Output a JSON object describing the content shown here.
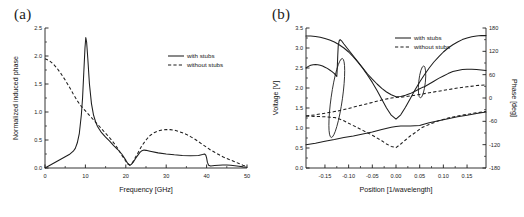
{
  "figure": {
    "background_color": "#ffffff",
    "line_color": "#1d1d1d",
    "panels": [
      "(a)",
      "(b)"
    ]
  },
  "panel_a": {
    "label": "(a)",
    "legend": {
      "position": "upper-right",
      "entries": [
        {
          "label": "with stubs",
          "style": "solid"
        },
        {
          "label": "without stubs",
          "style": "dashed"
        }
      ]
    }
  },
  "panel_b": {
    "label": "(b)",
    "legend": {
      "position": "upper-right",
      "entries": [
        {
          "label": "with stubs",
          "style": "solid"
        },
        {
          "label": "without stubs",
          "style": "dashed"
        }
      ]
    },
    "annotations": [
      {
        "name": "ellipse-left",
        "cx": -0.125,
        "cy_frac": 0.5,
        "rx": 0.012,
        "ry_frac": 0.285,
        "rotation": 8
      },
      {
        "name": "ellipse-right",
        "cx": 0.055,
        "cy_frac": 0.385,
        "rx": 0.007,
        "ry_frac": 0.115,
        "rotation": 6
      }
    ]
  },
  "chart_data": [
    {
      "id": "panel-a",
      "type": "line",
      "title": "(a)",
      "xlabel": "Frequency [GHz]",
      "ylabel": "Normalized induced phase",
      "xlim": [
        0,
        50
      ],
      "ylim": [
        0.0,
        2.5
      ],
      "xticks": [
        0,
        10,
        20,
        30,
        40,
        50
      ],
      "xticklabels": [
        "0",
        "10",
        "20",
        "30",
        "40",
        "50"
      ],
      "yticks": [
        0.0,
        0.5,
        1.0,
        1.5,
        2.0,
        2.5
      ],
      "yticklabels": [
        "0.0",
        "0.5",
        "1.0",
        "1.5",
        "2.0",
        "2.5"
      ],
      "xminor_count": 1,
      "yminor_count": 1,
      "grid": false,
      "legend_position": "upper right",
      "series": [
        {
          "name": "with stubs",
          "style": "solid",
          "x": [
            0,
            1,
            2,
            3,
            4,
            5,
            6,
            7,
            7.5,
            8,
            8.5,
            9,
            9.3,
            9.6,
            9.9,
            10.1,
            10.3,
            10.6,
            11,
            11.5,
            12,
            12.5,
            13,
            14,
            15,
            16,
            17,
            18,
            19,
            20,
            20.5,
            21,
            21.3,
            21.8,
            22.5,
            23,
            23.5,
            24,
            24.5,
            25,
            26,
            28,
            30,
            32,
            34,
            36,
            38,
            39,
            39.5,
            39.8,
            40,
            40.2,
            40.5,
            41,
            41.5,
            42,
            43,
            44,
            45,
            46,
            47,
            48,
            49,
            50
          ],
          "y": [
            0.0,
            0.04,
            0.08,
            0.12,
            0.16,
            0.2,
            0.24,
            0.3,
            0.35,
            0.45,
            0.62,
            0.95,
            1.25,
            1.7,
            2.15,
            2.33,
            2.25,
            1.95,
            1.5,
            1.15,
            0.95,
            0.83,
            0.74,
            0.63,
            0.55,
            0.48,
            0.4,
            0.33,
            0.25,
            0.14,
            0.08,
            0.05,
            0.06,
            0.1,
            0.18,
            0.23,
            0.28,
            0.31,
            0.32,
            0.315,
            0.3,
            0.27,
            0.25,
            0.235,
            0.225,
            0.22,
            0.225,
            0.24,
            0.25,
            0.23,
            0.18,
            0.1,
            0.05,
            0.035,
            0.04,
            0.045,
            0.05,
            0.055,
            0.055,
            0.05,
            0.04,
            0.03,
            0.02,
            0.015
          ]
        },
        {
          "name": "without stubs",
          "style": "dashed",
          "x": [
            0,
            1,
            2,
            3,
            4,
            5,
            6,
            7,
            8,
            9,
            10,
            11,
            12,
            13,
            14,
            15,
            16,
            17,
            18,
            19,
            20,
            20.5,
            21,
            21.5,
            22,
            23,
            24,
            25,
            26,
            27,
            28,
            29,
            30,
            31,
            32,
            33,
            34,
            35,
            36,
            37,
            38,
            39,
            40,
            41,
            42,
            43,
            44,
            45,
            46,
            47,
            48,
            49,
            50
          ],
          "y": [
            1.95,
            1.92,
            1.86,
            1.78,
            1.68,
            1.57,
            1.45,
            1.32,
            1.2,
            1.1,
            1.02,
            0.94,
            0.86,
            0.78,
            0.7,
            0.62,
            0.54,
            0.45,
            0.35,
            0.23,
            0.12,
            0.07,
            0.05,
            0.08,
            0.14,
            0.27,
            0.4,
            0.5,
            0.58,
            0.63,
            0.66,
            0.68,
            0.685,
            0.685,
            0.675,
            0.655,
            0.63,
            0.6,
            0.56,
            0.52,
            0.47,
            0.42,
            0.37,
            0.32,
            0.28,
            0.24,
            0.2,
            0.17,
            0.14,
            0.11,
            0.08,
            0.05,
            0.03
          ]
        }
      ]
    },
    {
      "id": "panel-b",
      "type": "line",
      "title": "(b)",
      "xlabel": "Position [1/wavelength]",
      "ylabel": "Voltage [V]",
      "y2label": "Phase [deg]",
      "xlim": [
        -0.19,
        0.19
      ],
      "ylim": [
        0.0,
        3.5
      ],
      "y2lim": [
        -180,
        180
      ],
      "xticks": [
        -0.15,
        -0.1,
        -0.05,
        0.0,
        0.05,
        0.1,
        0.15
      ],
      "xticklabels": [
        "-0.15",
        "-0.10",
        "-0.05",
        "0.00",
        "0.05",
        "0.10",
        "0.15"
      ],
      "yticks": [
        0.0,
        0.5,
        1.0,
        1.5,
        2.0,
        2.5,
        3.0,
        3.5
      ],
      "yticklabels": [
        "0.0",
        "0.5",
        "1.0",
        "1.5",
        "2.0",
        "2.5",
        "3.0",
        "3.5"
      ],
      "y2ticks": [
        -180,
        -120,
        -60,
        0,
        60,
        120,
        180
      ],
      "y2ticklabels": [
        "-180",
        "-120",
        "-60",
        "0",
        "60",
        "120",
        "180"
      ],
      "xminor_count": 1,
      "yminor_count": 1,
      "grid": false,
      "legend_position": "upper right",
      "series": [
        {
          "name": "with stubs (voltage, upper)",
          "style": "solid",
          "axis": "left",
          "x": [
            -0.19,
            -0.18,
            -0.17,
            -0.16,
            -0.15,
            -0.14,
            -0.13,
            -0.12,
            -0.11,
            -0.1,
            -0.09,
            -0.08,
            -0.07,
            -0.06,
            -0.05,
            -0.04,
            -0.03,
            -0.02,
            -0.01,
            0.0,
            0.01,
            0.02,
            0.03,
            0.04,
            0.05,
            0.06,
            0.07,
            0.08,
            0.09,
            0.1,
            0.11,
            0.12,
            0.13,
            0.14,
            0.15,
            0.16,
            0.17,
            0.18,
            0.19
          ],
          "y": [
            3.3,
            3.3,
            3.29,
            3.27,
            3.24,
            3.2,
            3.15,
            3.08,
            3.0,
            2.9,
            2.78,
            2.64,
            2.49,
            2.32,
            2.14,
            1.94,
            1.72,
            1.5,
            1.32,
            1.22,
            1.33,
            1.52,
            1.73,
            1.95,
            2.15,
            2.33,
            2.5,
            2.65,
            2.78,
            2.9,
            3.0,
            3.08,
            3.15,
            3.21,
            3.25,
            3.28,
            3.3,
            3.31,
            3.31
          ]
        },
        {
          "name": "with stubs (voltage, middle)",
          "style": "solid",
          "axis": "left",
          "x": [
            -0.19,
            -0.185,
            -0.18,
            -0.175,
            -0.17,
            -0.165,
            -0.16,
            -0.155,
            -0.15,
            -0.145,
            -0.14,
            -0.135,
            -0.13,
            -0.128,
            -0.126,
            -0.125,
            -0.124,
            -0.123,
            -0.122,
            -0.12,
            -0.118,
            -0.115,
            -0.11,
            -0.1,
            -0.09,
            -0.08,
            -0.07,
            -0.06,
            -0.05,
            -0.04,
            -0.03,
            -0.02,
            -0.01,
            0.0,
            0.01,
            0.02,
            0.03,
            0.04,
            0.05,
            0.055,
            0.06,
            0.07,
            0.08,
            0.09,
            0.1,
            0.11,
            0.12,
            0.13,
            0.14,
            0.15,
            0.16,
            0.17,
            0.18,
            0.19
          ],
          "y": [
            2.5,
            2.54,
            2.57,
            2.58,
            2.585,
            2.58,
            2.57,
            2.55,
            2.52,
            2.49,
            2.45,
            2.41,
            2.36,
            2.33,
            2.3,
            2.29,
            2.5,
            2.8,
            3.05,
            3.18,
            3.21,
            3.18,
            3.1,
            2.95,
            2.8,
            2.65,
            2.5,
            2.35,
            2.22,
            2.1,
            1.99,
            1.9,
            1.83,
            1.78,
            1.79,
            1.82,
            1.86,
            1.92,
            1.98,
            2.01,
            2.03,
            2.1,
            2.17,
            2.24,
            2.3,
            2.36,
            2.41,
            2.44,
            2.46,
            2.47,
            2.47,
            2.46,
            2.45,
            2.44
          ]
        },
        {
          "name": "with stubs (phase)",
          "style": "solid",
          "axis": "right",
          "x": [
            -0.19,
            -0.17,
            -0.15,
            -0.13,
            -0.11,
            -0.09,
            -0.07,
            -0.05,
            -0.03,
            -0.01,
            0.0,
            0.01,
            0.03,
            0.05,
            0.055,
            0.07,
            0.09,
            0.11,
            0.13,
            0.15,
            0.17,
            0.19
          ],
          "y_left": [
            0.58,
            0.62,
            0.67,
            0.71,
            0.76,
            0.8,
            0.85,
            0.9,
            0.96,
            1.02,
            1.04,
            1.05,
            1.05,
            1.06,
            1.08,
            1.13,
            1.18,
            1.23,
            1.28,
            1.32,
            1.36,
            1.4
          ]
        },
        {
          "name": "without stubs (voltage)",
          "style": "dashed",
          "axis": "left",
          "x": [
            -0.19,
            -0.17,
            -0.15,
            -0.13,
            -0.125,
            -0.11,
            -0.09,
            -0.07,
            -0.05,
            -0.03,
            -0.01,
            0.0,
            0.01,
            0.03,
            0.05,
            0.055,
            0.07,
            0.09,
            0.11,
            0.13,
            0.15,
            0.17,
            0.19
          ],
          "y": [
            1.3,
            1.33,
            1.37,
            1.41,
            1.42,
            1.46,
            1.52,
            1.58,
            1.64,
            1.7,
            1.75,
            1.76,
            1.77,
            1.8,
            1.84,
            1.85,
            1.88,
            1.92,
            1.96,
            2.0,
            2.03,
            2.06,
            2.08
          ]
        },
        {
          "name": "without stubs (phase)",
          "style": "dashed",
          "axis": "right",
          "x": [
            -0.19,
            -0.17,
            -0.15,
            -0.13,
            -0.125,
            -0.11,
            -0.09,
            -0.07,
            -0.05,
            -0.03,
            -0.02,
            -0.01,
            0.0,
            0.01,
            0.02,
            0.03,
            0.04,
            0.05,
            0.055,
            0.07,
            0.09,
            0.11,
            0.13,
            0.15,
            0.17,
            0.19
          ],
          "y_left": [
            1.3,
            1.29,
            1.28,
            1.26,
            1.25,
            1.18,
            1.06,
            0.94,
            0.82,
            0.68,
            0.6,
            0.54,
            0.51,
            0.6,
            0.7,
            0.8,
            0.88,
            0.97,
            1.01,
            1.09,
            1.18,
            1.25,
            1.3,
            1.34,
            1.38,
            1.41
          ]
        }
      ]
    }
  ]
}
